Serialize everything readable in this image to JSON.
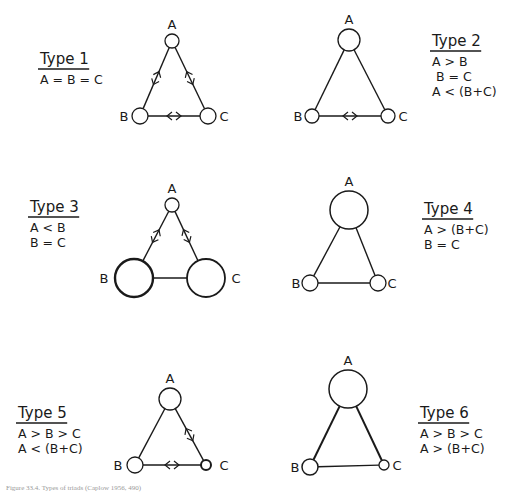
{
  "figure": {
    "caption": "Figure 33.4. Types of triads (Caplow 1956, 490)",
    "stroke_color": "#1a1a1a",
    "background": "#ffffff"
  },
  "panels": [
    {
      "id": "type1",
      "title": "Type 1",
      "relations": [
        "A = B = C"
      ],
      "label_pos": {
        "x": 40,
        "y": 64,
        "align": "left"
      },
      "nodes": {
        "A": {
          "x": 172,
          "y": 41,
          "r": 7,
          "w": 1.3,
          "label": "A",
          "lx": 172,
          "ly": 29
        },
        "B": {
          "x": 140,
          "y": 116,
          "r": 8,
          "w": 1.3,
          "label": "B",
          "lx": 124,
          "ly": 121
        },
        "C": {
          "x": 208,
          "y": 116,
          "r": 8,
          "w": 1.3,
          "label": "C",
          "lx": 224,
          "ly": 121
        }
      },
      "edges": [
        {
          "from": "A",
          "to": "B",
          "arrows": true
        },
        {
          "from": "A",
          "to": "C",
          "arrows": true
        },
        {
          "from": "B",
          "to": "C",
          "arrows": true
        }
      ]
    },
    {
      "id": "type2",
      "title": "Type 2",
      "relations": [
        "A > B",
        "B = C",
        "A < (B+C)"
      ],
      "label_pos": {
        "x": 432,
        "y": 46,
        "align": "left"
      },
      "nodes": {
        "A": {
          "x": 349,
          "y": 40,
          "r": 11,
          "w": 1.3,
          "label": "A",
          "lx": 349,
          "ly": 24
        },
        "B": {
          "x": 312,
          "y": 116,
          "r": 7,
          "w": 1.3,
          "label": "B",
          "lx": 298,
          "ly": 121
        },
        "C": {
          "x": 388,
          "y": 116,
          "r": 7,
          "w": 1.3,
          "label": "C",
          "lx": 403,
          "ly": 121
        }
      },
      "edges": [
        {
          "from": "A",
          "to": "B",
          "arrows": false
        },
        {
          "from": "A",
          "to": "C",
          "arrows": false
        },
        {
          "from": "B",
          "to": "C",
          "arrows": true
        }
      ]
    },
    {
      "id": "type3",
      "title": "Type 3",
      "relations": [
        "A < B",
        "B = C"
      ],
      "label_pos": {
        "x": 30,
        "y": 212,
        "align": "left"
      },
      "nodes": {
        "A": {
          "x": 172,
          "y": 205,
          "r": 7,
          "w": 1.3,
          "label": "A",
          "lx": 172,
          "ly": 193
        },
        "B": {
          "x": 134,
          "y": 278,
          "r": 19,
          "w": 2.4,
          "label": "B",
          "lx": 104,
          "ly": 283
        },
        "C": {
          "x": 206,
          "y": 278,
          "r": 19,
          "w": 1.8,
          "label": "C",
          "lx": 236,
          "ly": 283
        }
      },
      "edges": [
        {
          "from": "A",
          "to": "B",
          "arrows": true
        },
        {
          "from": "A",
          "to": "C",
          "arrows": true
        },
        {
          "from": "B",
          "to": "C",
          "arrows": false
        }
      ]
    },
    {
      "id": "type4",
      "title": "Type 4",
      "relations": [
        "A > (B+C)",
        "B = C"
      ],
      "label_pos": {
        "x": 424,
        "y": 214,
        "align": "left"
      },
      "nodes": {
        "A": {
          "x": 349,
          "y": 210,
          "r": 19,
          "w": 1.5,
          "label": "A",
          "lx": 349,
          "ly": 186
        },
        "B": {
          "x": 310,
          "y": 283,
          "r": 8,
          "w": 1.3,
          "label": "B",
          "lx": 296,
          "ly": 288
        },
        "C": {
          "x": 378,
          "y": 283,
          "r": 8,
          "w": 1.3,
          "label": "C",
          "lx": 392,
          "ly": 288
        }
      },
      "edges": [
        {
          "from": "A",
          "to": "B",
          "arrows": false
        },
        {
          "from": "A",
          "to": "C",
          "arrows": false
        },
        {
          "from": "B",
          "to": "C",
          "arrows": false
        }
      ]
    },
    {
      "id": "type5",
      "title": "Type 5",
      "relations": [
        "A > B > C",
        "A < (B+C)"
      ],
      "label_pos": {
        "x": 18,
        "y": 418,
        "align": "left"
      },
      "nodes": {
        "A": {
          "x": 170,
          "y": 399,
          "r": 11,
          "w": 1.3,
          "label": "A",
          "lx": 170,
          "ly": 383
        },
        "B": {
          "x": 135,
          "y": 465,
          "r": 8,
          "w": 1.3,
          "label": "B",
          "lx": 118,
          "ly": 470
        },
        "C": {
          "x": 206,
          "y": 465,
          "r": 5,
          "w": 2.0,
          "label": "C",
          "lx": 224,
          "ly": 470
        }
      },
      "edges": [
        {
          "from": "A",
          "to": "B",
          "arrows": false
        },
        {
          "from": "A",
          "to": "C",
          "arrows": true
        },
        {
          "from": "B",
          "to": "C",
          "arrows": true
        }
      ]
    },
    {
      "id": "type6",
      "title": "Type 6",
      "relations": [
        "A > B > C",
        "A > (B+C)"
      ],
      "label_pos": {
        "x": 420,
        "y": 418,
        "align": "left"
      },
      "nodes": {
        "A": {
          "x": 348,
          "y": 389,
          "r": 19,
          "w": 1.5,
          "label": "A",
          "lx": 348,
          "ly": 365
        },
        "B": {
          "x": 310,
          "y": 467,
          "r": 8,
          "w": 1.5,
          "label": "B",
          "lx": 295,
          "ly": 472
        },
        "C": {
          "x": 384,
          "y": 465,
          "r": 5,
          "w": 1.3,
          "label": "C",
          "lx": 397,
          "ly": 470
        }
      },
      "edges": [
        {
          "from": "A",
          "to": "B",
          "arrows": false,
          "w": 2.0
        },
        {
          "from": "A",
          "to": "C",
          "arrows": false,
          "w": 2.0
        },
        {
          "from": "B",
          "to": "C",
          "arrows": false
        }
      ]
    }
  ]
}
